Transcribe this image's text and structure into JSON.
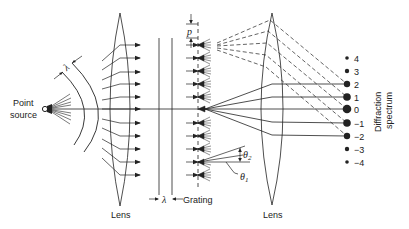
{
  "figure": {
    "labels": {
      "point_source_line1": "Point",
      "point_source_line2": "source",
      "lens_left": "Lens",
      "lens_right": "Lens",
      "grating": "Grating",
      "spectrum_line1": "Diffraction",
      "spectrum_line2": "spectrum",
      "lambda_top": "λ",
      "lambda_bottom": "λ",
      "period": "p",
      "theta1": "θ",
      "theta1_sub": "1",
      "theta2": "θ",
      "theta2_sub": "2"
    },
    "orders": [
      {
        "label": "4",
        "y": 58,
        "r": 1.8
      },
      {
        "label": "3",
        "y": 71,
        "r": 2.2
      },
      {
        "label": "2",
        "y": 84,
        "r": 3.2
      },
      {
        "label": "1",
        "y": 97,
        "r": 3.8
      },
      {
        "label": "0",
        "y": 109,
        "r": 4.3
      },
      {
        "label": "−1",
        "y": 123,
        "r": 3.8
      },
      {
        "label": "−2",
        "y": 136,
        "r": 3.2
      },
      {
        "label": "−3",
        "y": 149,
        "r": 2.2
      },
      {
        "label": "−4",
        "y": 162,
        "r": 1.8
      }
    ],
    "colors": {
      "ink": "#222222",
      "background": "#ffffff"
    }
  }
}
